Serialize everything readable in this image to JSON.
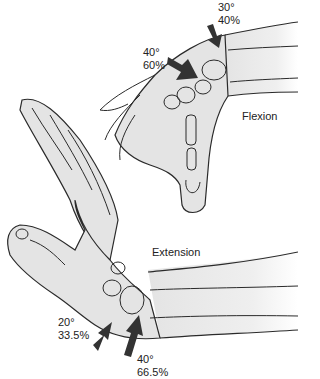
{
  "figure": {
    "colors": {
      "skin": "#e4e4e4",
      "outline": "#2a2a2a",
      "arrow": "#333333",
      "background": "#ffffff"
    }
  },
  "flexion": {
    "title": "Flexion",
    "arrows": [
      {
        "id": "midcarpal",
        "angle": "40°",
        "percent": "60%"
      },
      {
        "id": "radiocarpal",
        "angle": "30°",
        "percent": "40%"
      }
    ]
  },
  "extension": {
    "title": "Extension",
    "arrows": [
      {
        "id": "midcarpal",
        "angle": "20°",
        "percent": "33.5%"
      },
      {
        "id": "radiocarpal",
        "angle": "40°",
        "percent": "66.5%"
      }
    ]
  }
}
